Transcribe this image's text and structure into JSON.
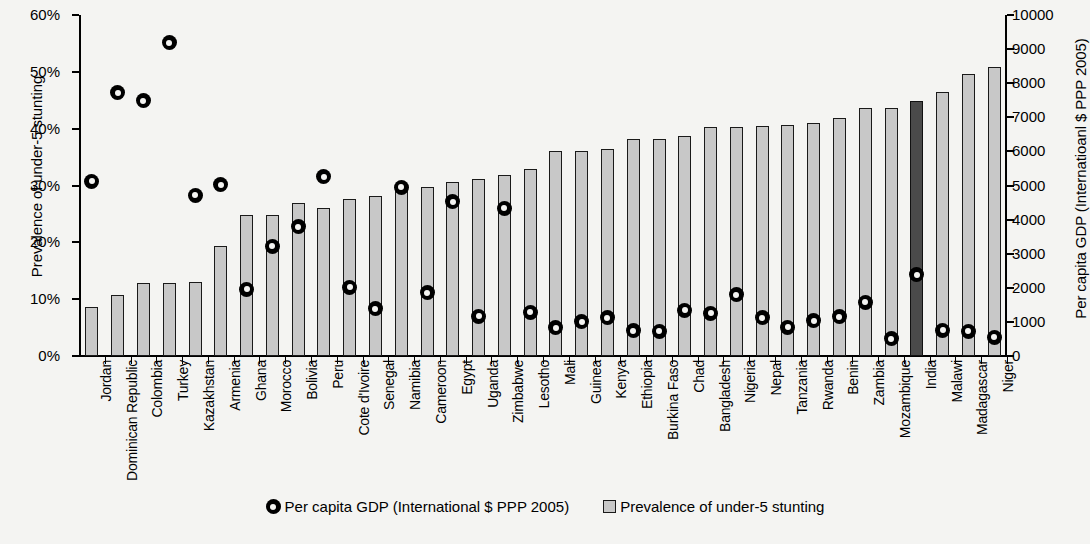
{
  "chart_data": {
    "type": "bar",
    "title": "",
    "xlabel": "",
    "ylabel": "Prevalence of under-5 stunting",
    "y2label": "Per capita GDP (Internatioanl $ PPP 2005)",
    "ylim": [
      0,
      0.6
    ],
    "y2lim": [
      0,
      10000
    ],
    "grid": false,
    "legend_position": "bottom-center",
    "yticks": [
      "0%",
      "10%",
      "20%",
      "30%",
      "40%",
      "50%",
      "60%"
    ],
    "y2ticks": [
      "0",
      "1000",
      "2000",
      "3000",
      "4000",
      "5000",
      "6000",
      "7000",
      "8000",
      "9000",
      "10000"
    ],
    "highlight_category": "India",
    "categories": [
      "Jordan",
      "Dominican Republic",
      "Colombia",
      "Turkey",
      "Kazakhstan",
      "Armenia",
      "Ghana",
      "Morocco",
      "Bolivia",
      "Peru",
      "Cote d'Ivoire",
      "Senegal",
      "Namibia",
      "Cameroon",
      "Egypt",
      "Uganda",
      "Zimbabwe",
      "Lesotho",
      "Mali",
      "Guinea",
      "Kenya",
      "Ethiopia",
      "Burkina Faso",
      "Chad",
      "Bangladesh",
      "Nigeria",
      "Nepal",
      "Tanzania",
      "Rwanda",
      "Benin",
      "Zambia",
      "Mozambique",
      "India",
      "Malawi",
      "Madagascar",
      "Niger"
    ],
    "series": [
      {
        "name": "Prevalence of under-5 stunting",
        "axis": "left",
        "unit": "fraction",
        "values": [
          0.087,
          0.107,
          0.129,
          0.129,
          0.13,
          0.193,
          0.249,
          0.249,
          0.269,
          0.261,
          0.277,
          0.281,
          0.298,
          0.298,
          0.307,
          0.312,
          0.318,
          0.329,
          0.36,
          0.36,
          0.365,
          0.381,
          0.382,
          0.387,
          0.403,
          0.403,
          0.405,
          0.407,
          0.41,
          0.418,
          0.437,
          0.437,
          0.449,
          0.464,
          0.496,
          0.508
        ]
      },
      {
        "name": "Per capita GDP (International $ PPP 2005)",
        "axis": "right",
        "unit": "international_dollars",
        "values": [
          5120,
          7720,
          7480,
          9180,
          4720,
          5020,
          1960,
          3220,
          3790,
          5250,
          2020,
          1380,
          4950,
          1850,
          4520,
          1170,
          4330,
          1280,
          830,
          1000,
          1120,
          740,
          720,
          1340,
          1250,
          1800,
          1120,
          840,
          1040,
          1150,
          1570,
          500,
          2380,
          760,
          730,
          550
        ]
      }
    ],
    "legend": [
      {
        "label": "Per capita GDP (International $ PPP 2005)",
        "marker": "circle",
        "color": "#000000"
      },
      {
        "label": "Prevalence of under-5 stunting",
        "marker": "square",
        "color": "#c8c8c8"
      }
    ]
  }
}
